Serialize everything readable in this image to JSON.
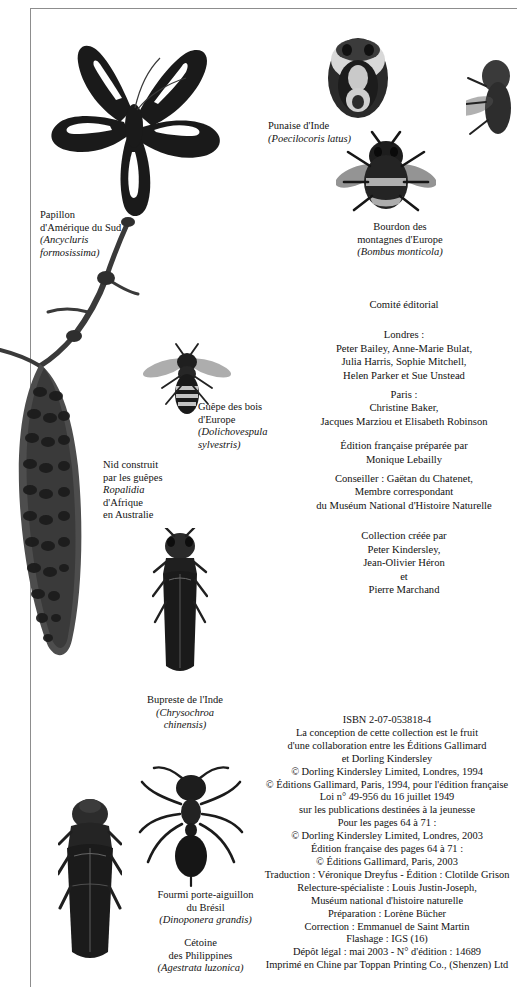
{
  "page": {
    "width": 517,
    "height": 987,
    "background": "#ffffff",
    "rule_color": "#8d8d8d"
  },
  "specimen_captions": [
    {
      "name": "butterfly",
      "common": [
        "Papillon",
        "d'Amérique du Sud"
      ],
      "scientific": [
        "(Ancycluris",
        "formosissima)"
      ]
    },
    {
      "name": "shield-bug",
      "common": [
        "Punaise d'Inde"
      ],
      "scientific": [
        "(Poecilocoris latus)"
      ]
    },
    {
      "name": "bumblebee",
      "common": [
        "Bourdon des",
        "montagnes d'Europe"
      ],
      "scientific": [
        "(Bombus monticola)"
      ]
    },
    {
      "name": "wasp",
      "common": [
        "Guêpe des bois",
        "d'Europe"
      ],
      "scientific": [
        "(Dolichovespula",
        "sylvestris)"
      ]
    },
    {
      "name": "wasp-nest",
      "common": [
        "Nid construit",
        "par les guêpes"
      ],
      "scientific": [
        "Ropalidia"
      ],
      "extra": [
        "d'Afrique",
        "en Australie"
      ]
    },
    {
      "name": "jewel-beetle",
      "common": [
        "Bupreste de l'Inde"
      ],
      "scientific": [
        "(Chrysochroa",
        "chinensis)"
      ]
    },
    {
      "name": "ant",
      "common": [
        "Fourmi porte-aiguillon",
        "du Brésil"
      ],
      "scientific": [
        "(Dinoponera grandis)"
      ]
    },
    {
      "name": "flower-beetle",
      "common": [
        "Cétoine",
        "des Philippines"
      ],
      "scientific": [
        "(Agestrata luzonica)"
      ]
    }
  ],
  "credits": {
    "heading": "Comité éditorial",
    "london_label": "Londres :",
    "london_names": [
      "Peter Bailey, Anne-Marie Bulat,",
      "Julia Harris, Sophie Mitchell,",
      "Helen Parker et Sue Unstead"
    ],
    "paris_label": "Paris :",
    "paris_names": [
      "Christine Baker,",
      "Jacques Marziou et Elisabeth Robinson"
    ],
    "french_edition": [
      "Édition française préparée par",
      "Monique Lebailly"
    ],
    "advisor": [
      "Conseiller : Gaëtan du Chatenet,",
      "Membre correspondant",
      "du Muséum National d'Histoire Naturelle"
    ],
    "collection": [
      "Collection créée par",
      "Peter Kindersley,",
      "Jean-Olivier Héron",
      "et",
      "Pierre Marchand"
    ]
  },
  "colophon": {
    "lines": [
      "ISBN 2-07-053818-4",
      "La conception de cette collection est le fruit",
      "d'une collaboration entre les Éditions Gallimard",
      "et Dorling Kindersley",
      "© Dorling Kindersley Limited, Londres, 1994",
      "© Éditions Gallimard, Paris, 1994, pour l'édition française",
      "Loi n° 49-956 du 16 juillet 1949",
      "sur les publications destinées à la jeunesse",
      "Pour les pages 64 à 71 :",
      "© Dorling Kindersley Limited, Londres, 2003",
      "Édition française des pages 64 à 71 :",
      "© Éditions Gallimard, Paris, 2003",
      "Traduction : Véronique Dreyfus - Édition : Clotilde Grison",
      "Relecture-spécialiste : Louis Justin-Joseph,",
      "Muséum national d'histoire naturelle",
      "Préparation : Lorène Bücher",
      "Correction : Emmanuel de Saint Martin",
      "Flashage : IGS (16)",
      "Dépôt légal : mai 2003 - N° d'édition : 14689",
      "Imprimé en Chine par Toppan Printing Co., (Shenzen) Ltd"
    ]
  }
}
